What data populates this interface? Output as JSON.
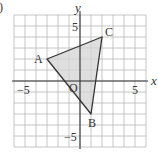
{
  "figure": {
    "item_marker": ")",
    "grid": {
      "min": -6,
      "max": 6,
      "step": 1,
      "color": "#b8b8b8"
    },
    "axes": {
      "x_label": "x",
      "y_label": "y",
      "origin_label": "O",
      "x_ticks": [
        {
          "value": -5,
          "label": "−5"
        },
        {
          "value": 5,
          "label": "5"
        }
      ],
      "y_ticks": [
        {
          "value": 5,
          "label": "5"
        },
        {
          "value": -5,
          "label": "−5"
        }
      ],
      "color": "#333333"
    },
    "triangle": {
      "vertices": [
        {
          "label": "A",
          "x": -3,
          "y": 2
        },
        {
          "label": "B",
          "x": 1,
          "y": -3
        },
        {
          "label": "C",
          "x": 2,
          "y": 4
        }
      ],
      "fill": "#d4d4d4",
      "stroke": "#333333"
    }
  }
}
